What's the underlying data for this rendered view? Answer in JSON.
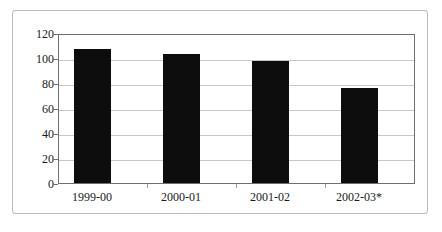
{
  "chart_data": {
    "type": "bar",
    "title": "",
    "subtitle": "",
    "xlabel": "",
    "ylabel": "",
    "categories": [
      "1999-00",
      "2000-01",
      "2001-02",
      "2002-03*"
    ],
    "values": [
      107,
      103,
      98,
      76
    ],
    "series": [
      {
        "name": "",
        "values": [
          107,
          103,
          98,
          76
        ]
      }
    ],
    "ylim": [
      0,
      120
    ],
    "y_ticks": [
      0,
      20,
      40,
      60,
      80,
      100,
      120
    ],
    "y_tick_labels": [
      "0",
      "20",
      "40",
      "60",
      "80",
      "100",
      "120"
    ],
    "grid": true,
    "grid_axis": "y",
    "legend": false,
    "legend_position": "none",
    "annotations": [],
    "footnote_marker": "*",
    "bar_color": "#0d0d0d",
    "gridline_color": "#c8c8c8",
    "axis_color": "#6f6f6f",
    "frame_color": "#b9b9b9",
    "background_color": "#ffffff"
  }
}
